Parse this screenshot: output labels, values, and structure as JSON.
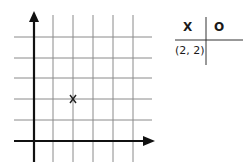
{
  "grid": {
    "point_marker": "X",
    "point": [
      2,
      2
    ],
    "colors": {
      "grid": "#8a8a8a",
      "axis": "#111111"
    }
  },
  "table": {
    "headers": [
      "X",
      "O"
    ],
    "rows": [
      [
        "(2, 2)",
        ""
      ]
    ]
  }
}
